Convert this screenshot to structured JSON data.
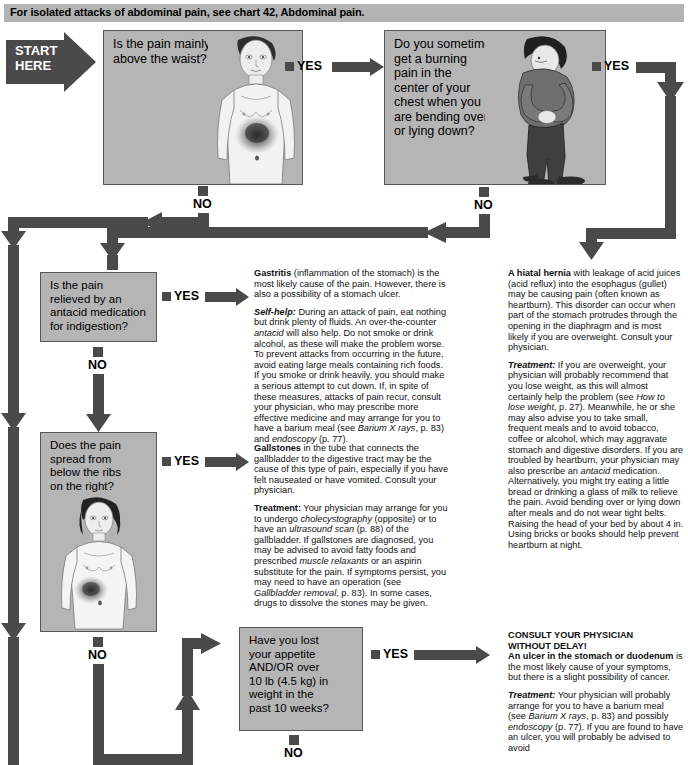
{
  "banner": {
    "text": "For isolated attacks of abdominal pain, see chart 42, Abdominal pain."
  },
  "start": {
    "label": "START\nHERE"
  },
  "labels": {
    "yes": "YES",
    "no": "NO"
  },
  "questions": [
    {
      "id": "q1",
      "text": "Is the pain mainly\nabove the waist?",
      "figure": "male-torso-chest-pain-figure"
    },
    {
      "id": "q2",
      "text": "Do you sometimes\nget a burning\npain in the\ncenter of your\nchest when you\nare bending over\nor lying down?",
      "figure": "man-bending-clutching-chest-figure"
    },
    {
      "id": "q3",
      "text": "Is the pain\nrelieved by an\nantacid medication\nfor indigestion?",
      "figure": "none"
    },
    {
      "id": "q4",
      "text": "Does the pain\nspread from\nbelow the ribs\non the right?",
      "figure": "standing-figure-abdomen-pain-figure"
    },
    {
      "id": "q5",
      "text": "Have you lost\nyour appetite\nAND/OR over\n10 lb (4.5 kg) in\nweight in the\npast 10 weeks?",
      "figure": "none"
    }
  ],
  "advice": {
    "gastritis": {
      "lead_bold": "Gastritis",
      "lead_rest": " (inflammation of the stomach) is the most likely cause of the pain. However, there is also a possibility of a stomach ulcer.",
      "selfhelp_label": "Self-help:",
      "selfhelp_text_1": " During an attack of pain, eat nothing but drink plenty of fluids. An over-the-counter ",
      "selfhelp_italic_1": "antacid",
      "selfhelp_text_2": " will also help. Do not smoke or drink alcohol, as these will make the problem worse. To prevent attacks from occurring in the future, avoid eating large meals containing rich foods. If you smoke or drink heavily, you should make a serious attempt to cut down. If, in spite of these measures, attacks of pain recur, consult your physician, who may prescribe more effective medicine and may arrange for you to have a barium meal (see ",
      "ref_1": "Barium X rays",
      "selfhelp_text_3": ", p. 83) and ",
      "ref_2": "endoscopy",
      "selfhelp_text_4": " (p. 77)."
    },
    "gallstones": {
      "lead_bold": "Gallstones",
      "lead_rest": " in the tube that connects the gallbladder to the digestive tract may be the cause of this type of pain, especially if you have felt nauseated or have vomited. Consult your physician.",
      "treatment_label": "Treatment:",
      "t1": " Your physician may arrange for you to undergo ",
      "i1": "cholecystography",
      "t2": " (opposite) or to have an ",
      "i2": "ultrasound scan",
      "t3": " (p. 88) of the gallbladder. If gallstones are diagnosed, you may be advised to avoid fatty foods and prescribed ",
      "i3": "muscle relaxants",
      "t4": " or an aspirin substitute for the pain. If symptoms persist, you may need to have an operation (see ",
      "i4": "Gallbladder removal",
      "t5": ", p. 83). In some cases, drugs to dissolve the stones may be given."
    },
    "hernia": {
      "lead_bold": "A hiatal hernia",
      "lead_rest": " with leakage of acid juices (acid reflux) into the esophagus (gullet) may be causing pain (often known as heartburn). This disorder can occur when part of the stomach protrudes through the opening in the diaphragm and is most likely if you are overweight. Consult your physician.",
      "treatment_label": "Treatment:",
      "t1": " If you are overweight, your physician will probably recommend that you lose weight, as this will almost certainly help the problem (see ",
      "i1": "How to lose weight",
      "t2": ", p. 27). Meanwhile, he or she may also advise you to take small, frequent meals and to avoid tobacco, coffee or alcohol, which may aggravate stomach and digestive disorders. If you are troubled by heartburn, your physician may also prescribe an ",
      "i2": "antacid",
      "t3": " medication. Alternatively, you might try eating a little bread or drinking a glass of milk to relieve the pain. Avoid bending over or lying down after meals and do not wear tight belts. Raising the head of your bed by about 4 in. Using bricks or books should help prevent heartburn at night."
    },
    "ulcer": {
      "alert_line1": "CONSULT YOUR PHYSICIAN",
      "alert_line2": "WITHOUT DELAY!",
      "lead_bold": "An ulcer in the stomach or duodenum",
      "lead_rest": " is the most likely cause of your symptoms, but there is a slight possibility of cancer.",
      "treatment_label": "Treatment:",
      "t1": " Your physician will probably arrange for you to have a barium meal (see ",
      "i1": "Barium X rays",
      "t2": ", p. 83) and possibly ",
      "i2": "endoscopy",
      "t3": " (p. 77). If you are found to have an ulcer, you will probably be advised to avoid"
    }
  },
  "colors": {
    "connector": "#4a4a4a",
    "box_fill": "#b5b5b5",
    "box_border": "#585858",
    "banner": "#b3b3b3"
  }
}
